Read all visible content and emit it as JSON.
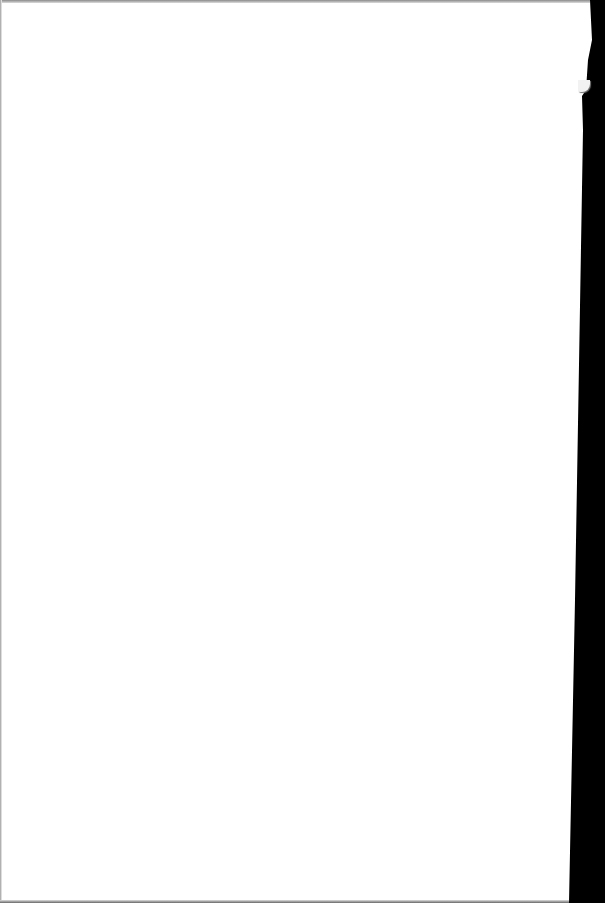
{
  "document": {
    "type": "scanned-page",
    "content": "",
    "page_color": "#ffffff",
    "scanner_background_color": "#000000",
    "edge_shadow_color": "#8a8a8a"
  }
}
